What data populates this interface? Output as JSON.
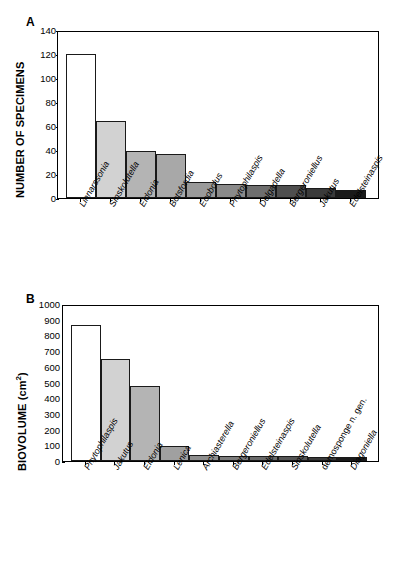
{
  "figure": {
    "panels": [
      {
        "letter": "A",
        "ylabel": "NUMBER OF SPECIMENS",
        "ylabel_sup": ""
      },
      {
        "letter": "B",
        "ylabel": "BIOVOLUME (cm",
        "ylabel_sup": "2",
        "ylabel_tail": ")"
      }
    ]
  },
  "chart_data": [
    {
      "type": "bar",
      "panel": "A",
      "title": "",
      "xlabel": "",
      "ylabel": "NUMBER OF SPECIMENS",
      "ylim": [
        0,
        140
      ],
      "ytick_step": 20,
      "yticks": [
        0,
        20,
        40,
        60,
        80,
        100,
        120,
        140
      ],
      "grid": false,
      "legend": "none",
      "categories": [
        "Linnarssonia",
        "Sinskolutella",
        "Eldonia",
        "Botsfordia",
        "Eoobolus",
        "Phytophilaspis",
        "Delgadella",
        "Bergeroniellus",
        "Jakutus",
        "Edelsteinaspis"
      ],
      "categories_italic": [
        true,
        true,
        true,
        true,
        true,
        true,
        true,
        true,
        true,
        true
      ],
      "values": [
        120,
        64,
        39,
        37,
        13,
        12,
        11,
        11,
        8,
        7
      ],
      "colors": [
        "#ffffff",
        "#d2d2d2",
        "#b4b4b4",
        "#a8a8a8",
        "#9a9a9a",
        "#8a8a8a",
        "#6e6e6e",
        "#4f4f4f",
        "#3a3a3a",
        "#1a1a1a"
      ]
    },
    {
      "type": "bar",
      "panel": "B",
      "title": "",
      "xlabel": "",
      "ylabel": "BIOVOLUME (cm2)",
      "ylim": [
        0,
        1000
      ],
      "ytick_step": 100,
      "yticks": [
        0,
        100,
        200,
        300,
        400,
        500,
        600,
        700,
        800,
        900,
        1000
      ],
      "grid": false,
      "legend": "none",
      "categories": [
        "Phytophilaspis",
        "Jakutus",
        "Eldonia",
        "Lenica",
        "Archiasterella",
        "Bergeroniellus",
        "Edelsteinaspis",
        "Sinskolutella",
        "demosponge n. gen.",
        "Diagoniella"
      ],
      "categories_italic": [
        true,
        true,
        true,
        true,
        true,
        true,
        true,
        true,
        false,
        true
      ],
      "values": [
        865,
        650,
        478,
        95,
        40,
        35,
        33,
        31,
        26,
        25
      ],
      "colors": [
        "#ffffff",
        "#d2d2d2",
        "#b4b4b4",
        "#a0a0a0",
        "#8e8e8e",
        "#7c7c7c",
        "#6a6a6a",
        "#555555",
        "#3a3a3a",
        "#1a1a1a"
      ]
    }
  ]
}
